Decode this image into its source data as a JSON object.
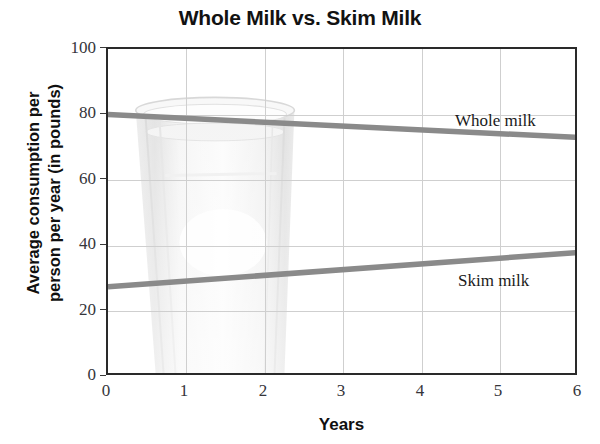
{
  "chart_data": {
    "type": "line",
    "title": "Whole Milk vs. Skim Milk",
    "xlabel": "Years",
    "ylabel": "Average consumption per\nperson per year (in pounds)",
    "xlim": [
      0,
      6
    ],
    "ylim": [
      0,
      100
    ],
    "xticks": [
      "0",
      "1",
      "2",
      "3",
      "4",
      "5",
      "6"
    ],
    "yticks": [
      "0",
      "20",
      "40",
      "60",
      "80",
      "100"
    ],
    "grid": true,
    "legend_position": "inline-right",
    "background_watermark": "drinking-glass-of-milk",
    "series": [
      {
        "name": "Whole milk",
        "label": "Whole milk",
        "color": "#8a8a8a",
        "x": [
          0,
          6
        ],
        "values": [
          80,
          73
        ]
      },
      {
        "name": "Skim milk",
        "label": "Skim milk",
        "color": "#8a8a8a",
        "x": [
          0,
          6
        ],
        "values": [
          27.5,
          38
        ]
      }
    ]
  },
  "colors": {
    "line": "#8a8a8a",
    "grid": "#cfcfcf",
    "frame": "#2a2a2a",
    "text": "#101010",
    "tick_text": "#35353a"
  }
}
